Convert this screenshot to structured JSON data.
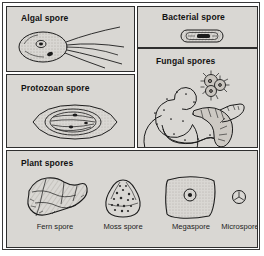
{
  "figure": {
    "title_visible": false,
    "background_color": "#ffffff",
    "panel_fill": "#d9d7d3",
    "ink_color": "#1b1b1b"
  },
  "panels": [
    {
      "id": "algal",
      "title": "Algal spore",
      "icon": "algal-spore-icon",
      "description": "Oval stippled cell with nucleus, eyespot and four trailing flagella"
    },
    {
      "id": "bacterial",
      "title": "Bacterial spore",
      "icon": "bacterial-spore-icon",
      "description": "Small rod-shaped capsule enclosing a dark endospore"
    },
    {
      "id": "protozoan",
      "title": "Protozoan spore",
      "icon": "protozoan-spore-icon",
      "description": "Pointed almond-shaped spore with nested walls and internal filaments"
    },
    {
      "id": "fungal",
      "title": "Fungal spores",
      "icon": "fungal-spores-icon",
      "description": "Coiled septate spiral spore, spiny clustered spore and three-armed segmented spore"
    },
    {
      "id": "plant",
      "title": "Plant spores",
      "icon": "plant-spores-icon",
      "description": "Four labelled plant spore types shown side by side"
    }
  ],
  "plant_spores": [
    {
      "label": "Fern spore",
      "icon": "fern-spore-icon",
      "description": "Irregular angular lumpy spore with shading"
    },
    {
      "label": "Moss spore",
      "icon": "moss-spore-icon",
      "description": "Rounded triangular spore speckled with granules"
    },
    {
      "label": "Megaspore",
      "icon": "megaspore-icon",
      "description": "Large rounded rectangular spore with central nucleus dot"
    },
    {
      "label": "Microspore",
      "icon": "microspore-icon",
      "description": "Tiny circular spore with trilete Y mark"
    }
  ]
}
